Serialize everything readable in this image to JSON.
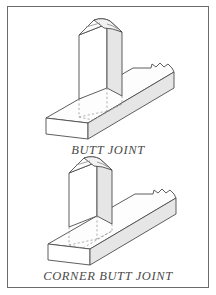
{
  "page": {
    "background_color": "#ffffff",
    "border_color": "#6b6b6b",
    "width": 216,
    "height": 295
  },
  "figures": [
    {
      "id": "butt-joint",
      "caption": "BUTT JOINT",
      "caption_color": "#4a4a4a",
      "description": "Isometric woodworking drawing: a vertical rectangular board positioned above the middle of a horizontal rail, with dashed projection lines showing where the end grain lands on the rail face",
      "parts": [
        {
          "name": "vertical-member",
          "shape": "rectangular board, end-on above rail"
        },
        {
          "name": "horizontal-member",
          "shape": "long rail with broken-off right end"
        },
        {
          "name": "projection-lines",
          "style": "dashed"
        }
      ]
    },
    {
      "id": "corner-butt-joint",
      "caption": "CORNER BUTT JOINT",
      "caption_color": "#4a4a4a",
      "description": "Isometric woodworking drawing: a vertical rectangular board positioned above the left end (corner) of a horizontal rail, with dashed projection lines showing the joint footprint at the corner",
      "parts": [
        {
          "name": "vertical-member",
          "shape": "rectangular board, end-on above rail corner"
        },
        {
          "name": "horizontal-member",
          "shape": "long rail with broken-off right end"
        },
        {
          "name": "projection-lines",
          "style": "dashed"
        }
      ]
    }
  ],
  "style": {
    "line_color": "#4d4d4d",
    "dashed_line_color": "#9a9a9a",
    "shaded_face_color": "#e6e6e6",
    "light_face_color": "#ffffff"
  }
}
